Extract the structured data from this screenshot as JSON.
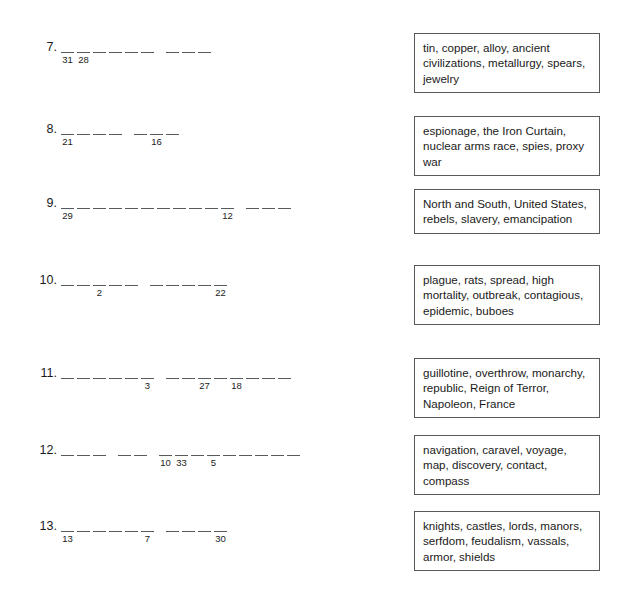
{
  "page": {
    "background_color": "#ffffff",
    "rule_color": "#555a5e",
    "box_border_color": "#58595b",
    "text_color": "#1a1a1a"
  },
  "items": [
    {
      "number": "7.",
      "top": 40,
      "clue_top": 33,
      "clue": "tin, copper, alloy, ancient civilizations, metallurgy, spears, jewelry",
      "groups": [
        {
          "slots": [
            {
              "index": "31"
            },
            {
              "index": "28"
            },
            {
              "index": ""
            },
            {
              "index": ""
            },
            {
              "index": ""
            },
            {
              "index": ""
            }
          ]
        },
        {
          "slots": [
            {
              "index": ""
            },
            {
              "index": ""
            },
            {
              "index": ""
            }
          ]
        }
      ]
    },
    {
      "number": "8.",
      "top": 122,
      "clue_top": 116,
      "clue": "espionage, the Iron Curtain, nuclear arms race, spies, proxy war",
      "groups": [
        {
          "slots": [
            {
              "index": "21"
            },
            {
              "index": ""
            },
            {
              "index": ""
            },
            {
              "index": ""
            }
          ]
        },
        {
          "slots": [
            {
              "index": ""
            },
            {
              "index": "16"
            },
            {
              "index": ""
            }
          ]
        }
      ]
    },
    {
      "number": "9.",
      "top": 196,
      "clue_top": 189,
      "clue": "North and South, United States, rebels, slavery, emancipation",
      "groups": [
        {
          "slots": [
            {
              "index": "29"
            },
            {
              "index": ""
            },
            {
              "index": ""
            },
            {
              "index": ""
            },
            {
              "index": ""
            },
            {
              "index": ""
            },
            {
              "index": ""
            },
            {
              "index": ""
            },
            {
              "index": ""
            },
            {
              "index": ""
            },
            {
              "index": "12"
            }
          ]
        },
        {
          "slots": [
            {
              "index": ""
            },
            {
              "index": ""
            },
            {
              "index": ""
            }
          ]
        }
      ]
    },
    {
      "number": "10.",
      "top": 273,
      "clue_top": 265,
      "clue": "plague, rats, spread, high mortality, outbreak, contagious, epidemic, buboes",
      "groups": [
        {
          "slots": [
            {
              "index": ""
            },
            {
              "index": ""
            },
            {
              "index": "2"
            },
            {
              "index": ""
            },
            {
              "index": ""
            }
          ]
        },
        {
          "slots": [
            {
              "index": ""
            },
            {
              "index": ""
            },
            {
              "index": ""
            },
            {
              "index": ""
            },
            {
              "index": "22"
            }
          ]
        }
      ]
    },
    {
      "number": "11.",
      "top": 366,
      "clue_top": 358,
      "clue": "guillotine, overthrow, monarchy, republic, Reign of Terror, Napoleon, France",
      "groups": [
        {
          "slots": [
            {
              "index": ""
            },
            {
              "index": ""
            },
            {
              "index": ""
            },
            {
              "index": ""
            },
            {
              "index": ""
            },
            {
              "index": "3"
            }
          ]
        },
        {
          "slots": [
            {
              "index": ""
            },
            {
              "index": ""
            },
            {
              "index": "27"
            },
            {
              "index": ""
            },
            {
              "index": "18"
            },
            {
              "index": ""
            },
            {
              "index": ""
            },
            {
              "index": ""
            }
          ]
        }
      ]
    },
    {
      "number": "12.",
      "top": 443,
      "clue_top": 435,
      "clue": "navigation, caravel, voyage, map, discovery, contact, compass",
      "groups": [
        {
          "slots": [
            {
              "index": ""
            },
            {
              "index": ""
            },
            {
              "index": ""
            }
          ]
        },
        {
          "slots": [
            {
              "index": ""
            },
            {
              "index": ""
            }
          ]
        },
        {
          "slots": [
            {
              "index": "10"
            },
            {
              "index": "33"
            },
            {
              "index": ""
            },
            {
              "index": "5"
            },
            {
              "index": ""
            },
            {
              "index": ""
            },
            {
              "index": ""
            },
            {
              "index": ""
            },
            {
              "index": ""
            }
          ]
        }
      ]
    },
    {
      "number": "13.",
      "top": 519,
      "clue_top": 511,
      "clue": "knights, castles, lords, manors, serfdom, feudalism, vassals, armor, shields",
      "groups": [
        {
          "slots": [
            {
              "index": "13"
            },
            {
              "index": ""
            },
            {
              "index": ""
            },
            {
              "index": ""
            },
            {
              "index": ""
            },
            {
              "index": "7"
            }
          ]
        },
        {
          "slots": [
            {
              "index": ""
            },
            {
              "index": ""
            },
            {
              "index": ""
            },
            {
              "index": "30"
            }
          ]
        }
      ]
    }
  ]
}
